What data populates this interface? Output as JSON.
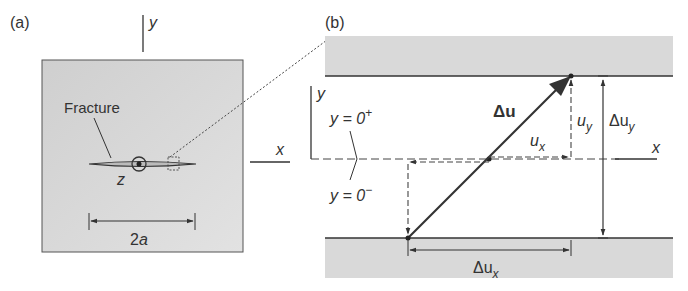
{
  "panel_a": {
    "label": "(a)",
    "axis_y": "y",
    "axis_x": "x",
    "axis_z": "z",
    "fracture_label": "Fracture",
    "length_label_num": "2",
    "length_label_var": "a"
  },
  "panel_b": {
    "label": "(b)",
    "axis_y": "y",
    "axis_x": "x",
    "y_plus_label": "y = 0",
    "y_plus_sup": "+",
    "y_minus_label": "y = 0",
    "y_minus_sup": "−",
    "delta_u_label": "Δu",
    "ux_label": "u",
    "ux_sub": "x",
    "uy_label": "u",
    "uy_sub": "y",
    "delta_uy_label": "Δu",
    "delta_uy_sub": "y",
    "delta_ux_label": "Δu",
    "delta_ux_sub": "x"
  },
  "colors": {
    "plate_fill": "#d6d6d6",
    "line": "#333333",
    "background": "#ffffff"
  }
}
